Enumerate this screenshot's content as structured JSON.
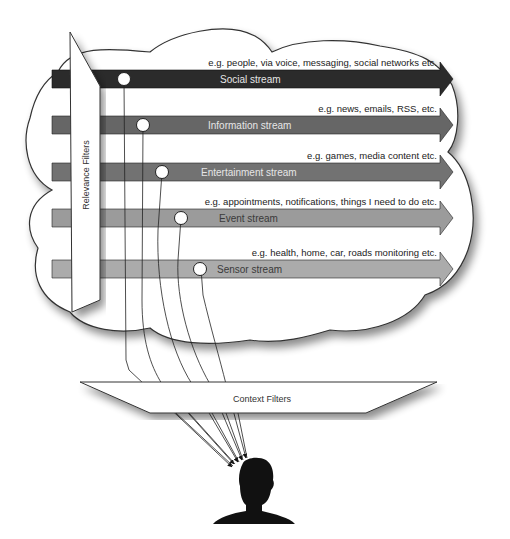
{
  "diagram": {
    "relevance_filter": {
      "label": "Relevance Filters"
    },
    "context_filter": {
      "label": "Context Filters"
    },
    "streams": [
      {
        "id": "social",
        "label": "Social stream",
        "example": "e.g. people, via voice, messaging, social networks etc.",
        "color": "#2b2b2b",
        "text_color": "#e6e6e6"
      },
      {
        "id": "information",
        "label": "Information stream",
        "example": "e.g. news, emails, RSS, etc.",
        "color": "#666666",
        "text_color": "#e6e6e6"
      },
      {
        "id": "entertainment",
        "label": "Entertainment stream",
        "example": "e.g. games, media content etc.",
        "color": "#727272",
        "text_color": "#e6e6e6"
      },
      {
        "id": "event",
        "label": "Event stream",
        "example": "e.g. appointments, notifications,  things I need to do etc.",
        "color": "#9b9b9b",
        "text_color": "#3a3a3a"
      },
      {
        "id": "sensor",
        "label": "Sensor stream",
        "example": "e.g. health, home, car, roads monitoring etc.",
        "color": "#ababab",
        "text_color": "#3a3a3a"
      }
    ],
    "user": {
      "icon": "person-silhouette-icon"
    }
  }
}
